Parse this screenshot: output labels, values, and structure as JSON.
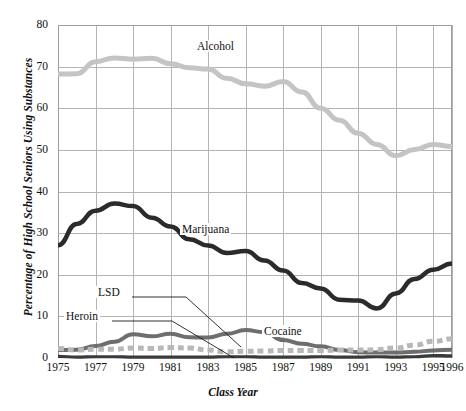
{
  "chart_data": {
    "type": "line",
    "title": "",
    "xlabel": "Class Year",
    "ylabel": "Percentage of High School Seniors Using Substances",
    "xlim": [
      1975,
      1996
    ],
    "ylim": [
      0,
      80
    ],
    "grid": true,
    "legend_position": "inline-labels",
    "x": [
      1975,
      1976,
      1977,
      1978,
      1979,
      1980,
      1981,
      1982,
      1983,
      1984,
      1985,
      1986,
      1987,
      1988,
      1989,
      1990,
      1991,
      1992,
      1993,
      1994,
      1995,
      1996
    ],
    "xtick_labels": [
      "1975",
      "1977",
      "1979",
      "1981",
      "1983",
      "1985",
      "1987",
      "1989",
      "1991",
      "1993",
      "1995",
      "1996"
    ],
    "ytick_labels": [
      "0",
      "10",
      "20",
      "30",
      "40",
      "50",
      "60",
      "70",
      "80"
    ],
    "series": [
      {
        "name": "Alcohol",
        "color": "#c4c4c4",
        "style": "solid",
        "width": 5,
        "values": [
          68.2,
          68.3,
          71.2,
          72.1,
          71.8,
          72.0,
          70.7,
          69.7,
          69.4,
          67.2,
          65.9,
          65.3,
          66.4,
          63.9,
          60.0,
          57.1,
          54.0,
          51.3,
          48.6,
          50.1,
          51.3,
          50.8
        ]
      },
      {
        "name": "Marijuana",
        "color": "#2b2b2b",
        "style": "solid",
        "width": 4.5,
        "values": [
          27.1,
          32.2,
          35.4,
          37.1,
          36.5,
          33.7,
          31.6,
          28.5,
          27.0,
          25.2,
          25.7,
          23.4,
          21.0,
          18.0,
          16.7,
          14.0,
          13.8,
          11.9,
          15.5,
          19.0,
          21.2,
          22.7
        ]
      },
      {
        "name": "Cocaine",
        "color": "#6e6e6e",
        "style": "solid",
        "width": 4,
        "values": [
          1.9,
          2.0,
          2.9,
          3.9,
          5.7,
          5.2,
          5.8,
          5.0,
          4.9,
          5.8,
          6.7,
          6.2,
          4.3,
          3.4,
          2.8,
          1.9,
          1.4,
          1.3,
          1.3,
          1.5,
          1.8,
          2.0
        ]
      },
      {
        "name": "LSD",
        "color": "#b8b8b8",
        "style": "dashed",
        "width": 5,
        "values": [
          2.3,
          1.9,
          2.1,
          2.1,
          2.4,
          2.3,
          2.5,
          2.4,
          1.9,
          1.5,
          1.6,
          1.7,
          1.8,
          1.8,
          1.8,
          1.9,
          1.9,
          2.0,
          2.4,
          3.1,
          4.0,
          4.6
        ]
      },
      {
        "name": "Heroin",
        "color": "#3a3a3a",
        "style": "solid",
        "width": 3.2,
        "values": [
          0.4,
          0.2,
          0.3,
          0.3,
          0.2,
          0.2,
          0.2,
          0.2,
          0.2,
          0.3,
          0.3,
          0.2,
          0.2,
          0.2,
          0.3,
          0.2,
          0.2,
          0.3,
          0.2,
          0.3,
          0.6,
          0.5
        ]
      }
    ],
    "annotations": [
      {
        "name": "Alcohol",
        "label": "Alcohol"
      },
      {
        "name": "Marijuana",
        "label": "Marijuana"
      },
      {
        "name": "Cocaine",
        "label": "Cocaine"
      },
      {
        "name": "LSD",
        "label": "LSD"
      },
      {
        "name": "Heroin",
        "label": "Heroin"
      }
    ]
  },
  "axes": {
    "y_title": "Percentage of High School Seniors Using Substances",
    "x_title": "Class Year"
  },
  "labels": {
    "alcohol": "Alcohol",
    "marijuana": "Marijuana",
    "cocaine": "Cocaine",
    "lsd": "LSD",
    "heroin": "Heroin"
  },
  "colors": {
    "alcohol": "#c4c4c4",
    "marijuana": "#2b2b2b",
    "cocaine": "#6e6e6e",
    "lsd": "#b8b8b8",
    "heroin": "#3a3a3a",
    "grid": "#b4b4b4",
    "frame": "#9d9d9d"
  }
}
